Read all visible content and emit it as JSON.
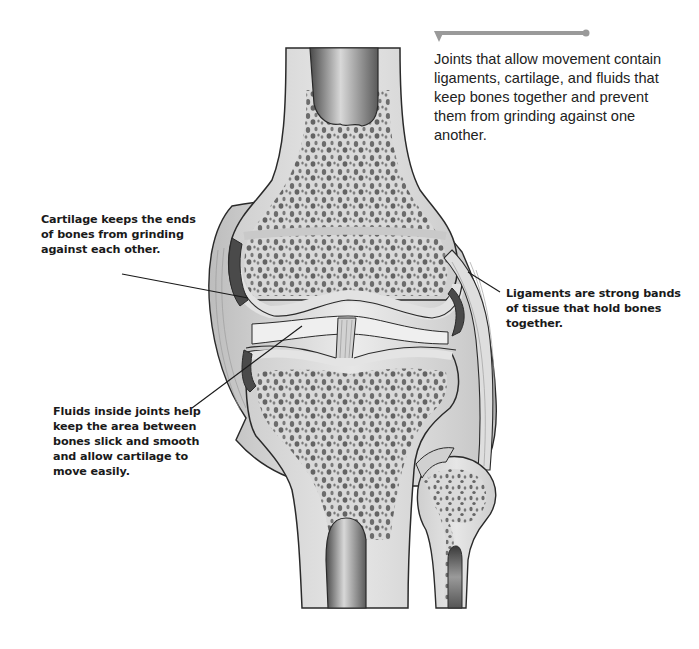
{
  "diagram": {
    "intro_text": "Joints that allow movement contain ligaments, cartilage, and fluids that keep bones together and prevent them from grinding against one another.",
    "labels": [
      {
        "id": "cartilage",
        "text": "Cartilage keeps the ends of bones from grinding against each other."
      },
      {
        "id": "ligaments",
        "text": "Ligaments are strong bands of tissue that hold bones together."
      },
      {
        "id": "fluids",
        "text": "Fluids inside joints help keep the area between bones slick and smooth and allow cartilage to move easily."
      }
    ],
    "colors": {
      "callout_bar": "#9a9a9a",
      "leader_line": "#1a1a1a",
      "bone_outline": "#2a2a2a",
      "bone_fill": "#dcdcdc",
      "spongy_holes": "#6a6a6a",
      "marrow_dark": "#555555",
      "cartilage_dark": "#4a4a4a",
      "ligament": "#cfcfcf"
    }
  }
}
